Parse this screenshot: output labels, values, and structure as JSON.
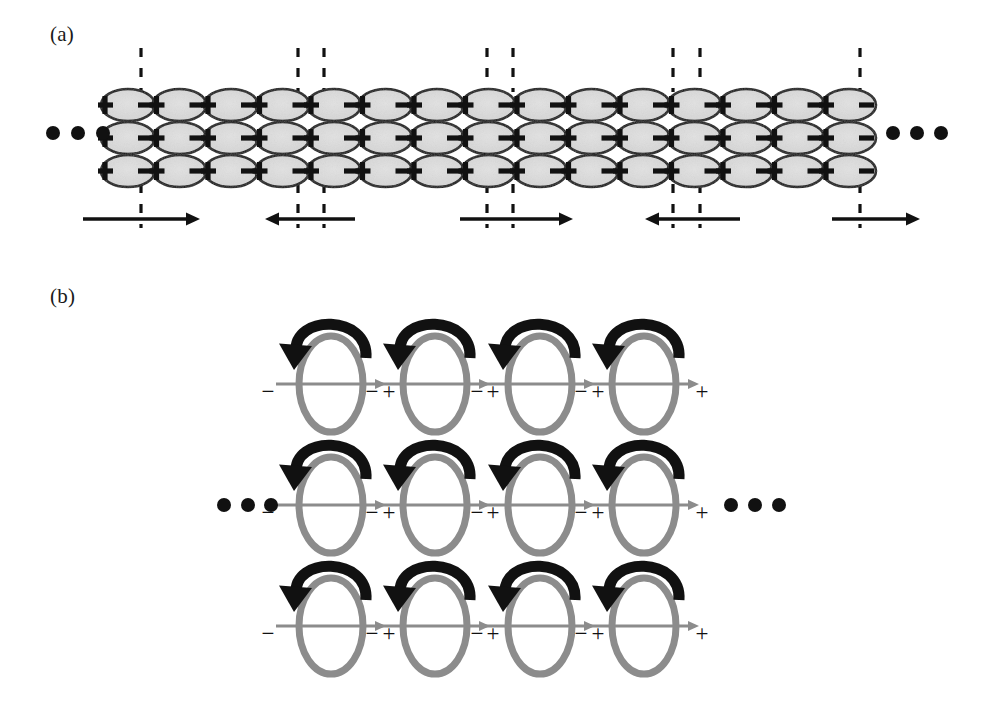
{
  "figure": {
    "width": 987,
    "height": 725,
    "background": "#ffffff"
  },
  "panels": [
    {
      "id": "a",
      "label": "(a)",
      "label_x": 50,
      "label_y": 22,
      "description": "Chain of elliptical dipoles arranged in three rows with head-to-head and tail-to-tail domain walls marked by dashed vertical lines; alternating polarization direction arrows below."
    },
    {
      "id": "b",
      "label": "(b)",
      "label_x": 50,
      "label_y": 284,
      "description": "Three rows of four vertical toroidal rings, each with a black curved rotation arrow over the top and a grey horizontal polarization arrow pointing from minus to plus."
    }
  ],
  "panel_a": {
    "rows_y": [
      105,
      138,
      171
    ],
    "ellipse": {
      "count_per_row": 15,
      "start_x": 128,
      "pitch": 51.5,
      "rx": 27,
      "ry": 16,
      "fill": "#d9d9d9",
      "stroke": "#111111",
      "stroke_width": 2.6
    },
    "polarity_left_symbol": "+",
    "polarity_right_symbol": "−",
    "dashed_lines": {
      "color": "#111111",
      "width": 3.2,
      "dash": "9 11",
      "top_y1": 48,
      "top_y2": 92,
      "bottom_y1": 184,
      "bottom_y2": 228,
      "x_positions": [
        141,
        298,
        324,
        487,
        513,
        673,
        700,
        860
      ]
    },
    "ellipsis_left": {
      "cx": [
        53,
        78,
        103
      ],
      "cy": 133,
      "r": 7,
      "color": "#111111"
    },
    "ellipsis_right": {
      "cx": [
        893,
        917,
        941
      ],
      "cy": 133,
      "r": 7,
      "color": "#111111"
    },
    "arrows": [
      {
        "x1": 83,
        "x2": 200,
        "y": 219,
        "direction": "right"
      },
      {
        "x1": 355,
        "x2": 265,
        "y": 219,
        "direction": "left"
      },
      {
        "x1": 460,
        "x2": 573,
        "y": 219,
        "direction": "right"
      },
      {
        "x1": 740,
        "x2": 645,
        "y": 219,
        "direction": "left"
      },
      {
        "x1": 832,
        "x2": 920,
        "y": 219,
        "direction": "right"
      }
    ],
    "arrow_style": {
      "color": "#111111",
      "width": 3.4,
      "head_length": 14,
      "head_half_width": 6.5
    }
  },
  "panel_b": {
    "rows_y": [
      384,
      505,
      626
    ],
    "columns_x": [
      331,
      435,
      540,
      644
    ],
    "ring": {
      "rx": 32,
      "ry": 48,
      "stroke": "#8c8c8c",
      "stroke_width": 7
    },
    "horizontal_arrow": {
      "half_length": 55,
      "color": "#8c8c8c",
      "width": 3.2,
      "head_length": 11,
      "head_half_width": 5,
      "direction": "right"
    },
    "curved_arrow": {
      "color": "#111111",
      "width": 11,
      "head_length": 24,
      "head_half_width": 14,
      "description": "black arc over the top of the ring, sweeping from the right side over to the left and terminating in a downward-left arrowhead"
    },
    "minus_symbol": "−",
    "plus_symbol": "+",
    "minus_offset_x": -63,
    "plus_offset_x": 58,
    "sign_offset_y": 15,
    "sign_font_size": 23,
    "sign_color": "#111111",
    "ellipsis_left": {
      "cx": [
        224,
        248,
        271
      ],
      "cy": 505,
      "r": 7,
      "color": "#111111"
    },
    "ellipsis_right": {
      "cx": [
        731,
        755,
        779
      ],
      "cy": 505,
      "r": 7,
      "color": "#111111"
    }
  }
}
